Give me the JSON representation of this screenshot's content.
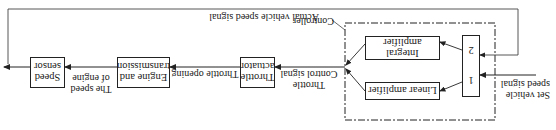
{
  "diagram": {
    "orientation": "rotated-180",
    "inputs": {
      "set_speed_line1": "Set vehicle",
      "set_speed_line2": "speed signal"
    },
    "controller": {
      "label": "Controller",
      "selector_labels": [
        "1",
        "2"
      ],
      "linear_amplifier": "Linear amplifier",
      "integral_amplifier": "Integral amplifier"
    },
    "signals": {
      "control_line1": "Throttle",
      "control_line2": "Control signal",
      "throttle_opening": "Throttle opening",
      "engine_speed_line1": "The speed",
      "engine_speed_line2": "of engine",
      "feedback": "Actual vehicle speed signal"
    },
    "blocks": {
      "throttle_actuator_line1": "Throttle",
      "throttle_actuator_line2": "actuator",
      "engine_line1": "Engine and",
      "engine_line2": "transmission",
      "sensor_line1": "Speed",
      "sensor_line2": "sensor"
    }
  }
}
